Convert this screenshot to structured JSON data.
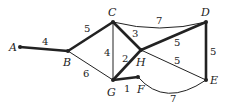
{
  "graph": {
    "nodes": [
      {
        "id": "A",
        "x": 20,
        "y": 47,
        "lx": 9,
        "ly": 51
      },
      {
        "id": "B",
        "x": 68,
        "y": 51,
        "lx": 63,
        "ly": 66
      },
      {
        "id": "C",
        "x": 113,
        "y": 22,
        "lx": 108,
        "ly": 16
      },
      {
        "id": "D",
        "x": 206,
        "y": 22,
        "lx": 201,
        "ly": 16
      },
      {
        "id": "E",
        "x": 206,
        "y": 80,
        "lx": 210,
        "ly": 84
      },
      {
        "id": "F",
        "x": 138,
        "y": 77,
        "lx": 137,
        "ly": 93
      },
      {
        "id": "G",
        "x": 113,
        "y": 80,
        "lx": 107,
        "ly": 96
      },
      {
        "id": "H",
        "x": 141,
        "y": 50,
        "lx": 136,
        "ly": 66
      }
    ],
    "edges": [
      {
        "from": "A",
        "to": "B",
        "weight": "4",
        "bold": true,
        "wx": 42,
        "wy": 45
      },
      {
        "from": "B",
        "to": "C",
        "weight": "5",
        "bold": true,
        "wx": 84,
        "wy": 32
      },
      {
        "from": "B",
        "to": "G",
        "weight": "6",
        "bold": false,
        "wx": 83,
        "wy": 77
      },
      {
        "from": "C",
        "to": "G",
        "weight": "4",
        "bold": false,
        "wx": 104,
        "wy": 56
      },
      {
        "from": "C",
        "to": "H",
        "weight": "3",
        "bold": true,
        "wx": 132,
        "wy": 37
      },
      {
        "from": "G",
        "to": "H",
        "weight": "2",
        "bold": true,
        "wx": 122,
        "wy": 62
      },
      {
        "from": "H",
        "to": "D",
        "weight": "5",
        "bold": true,
        "wx": 174,
        "wy": 46
      },
      {
        "from": "H",
        "to": "E",
        "weight": "5",
        "bold": false,
        "wx": 174,
        "wy": 64
      },
      {
        "from": "C",
        "to": "D",
        "weight": "7",
        "bold": false,
        "curve": "M113,22 Q160,34 206,22",
        "wx": 156,
        "wy": 24
      },
      {
        "from": "D",
        "to": "E",
        "weight": "5",
        "bold": true,
        "wx": 210,
        "wy": 55
      },
      {
        "from": "G",
        "to": "F",
        "weight": "1",
        "bold": true,
        "wx": 124,
        "wy": 92
      },
      {
        "from": "F",
        "to": "E",
        "weight": "7",
        "bold": false,
        "curve": "M138,77 Q165,108 206,80",
        "wx": 170,
        "wy": 102
      }
    ]
  }
}
